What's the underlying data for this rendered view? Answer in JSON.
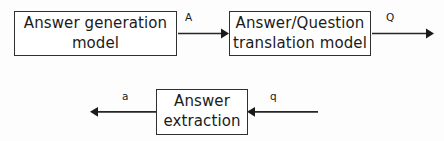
{
  "diagram": {
    "background_color": "#fdfdfd",
    "stroke_color": "#262626",
    "text_color": "#1b1b1b",
    "nodes": [
      {
        "id": "answer_generation",
        "label": "Answer generation\nmodel"
      },
      {
        "id": "translation",
        "label": "Answer/Question\ntranslation model"
      },
      {
        "id": "answer_extraction",
        "label": "Answer\nextraction"
      }
    ],
    "edges": [
      {
        "id": "gen_to_translation",
        "label": "A",
        "from": "answer_generation",
        "to": "translation",
        "direction": "right"
      },
      {
        "id": "translation_out",
        "label": "Q",
        "from": "translation",
        "to": "",
        "direction": "right"
      },
      {
        "id": "extraction_out",
        "label": "a",
        "from": "answer_extraction",
        "to": "",
        "direction": "left"
      },
      {
        "id": "into_extraction",
        "label": "q",
        "from": "",
        "to": "answer_extraction",
        "direction": "left"
      }
    ]
  }
}
